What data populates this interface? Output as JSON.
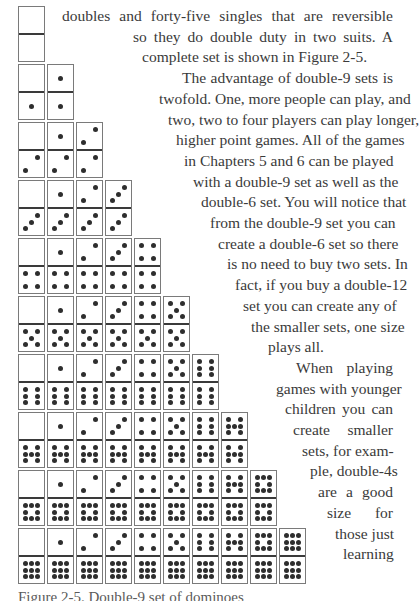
{
  "figure": {
    "name": "double-9 domino set",
    "origin_x": 18,
    "origin_y": 6,
    "col_pitch": 29,
    "row_pitch": 58,
    "rows": [
      [
        [
          0,
          0
        ]
      ],
      [
        [
          0,
          1
        ],
        [
          1,
          1
        ]
      ],
      [
        [
          0,
          2
        ],
        [
          1,
          2
        ],
        [
          2,
          2
        ]
      ],
      [
        [
          0,
          3
        ],
        [
          1,
          3
        ],
        [
          2,
          3
        ],
        [
          3,
          3
        ]
      ],
      [
        [
          0,
          4
        ],
        [
          1,
          4
        ],
        [
          2,
          4
        ],
        [
          3,
          4
        ],
        [
          4,
          4
        ]
      ],
      [
        [
          0,
          5
        ],
        [
          1,
          5
        ],
        [
          2,
          5
        ],
        [
          3,
          5
        ],
        [
          4,
          5
        ],
        [
          5,
          5
        ]
      ],
      [
        [
          0,
          6
        ],
        [
          1,
          6
        ],
        [
          2,
          6
        ],
        [
          3,
          6
        ],
        [
          4,
          6
        ],
        [
          5,
          6
        ],
        [
          6,
          6
        ]
      ],
      [
        [
          0,
          7
        ],
        [
          1,
          7
        ],
        [
          2,
          7
        ],
        [
          3,
          7
        ],
        [
          4,
          7
        ],
        [
          5,
          7
        ],
        [
          6,
          7
        ],
        [
          7,
          7
        ]
      ],
      [
        [
          0,
          8
        ],
        [
          1,
          8
        ],
        [
          2,
          8
        ],
        [
          3,
          8
        ],
        [
          4,
          8
        ],
        [
          5,
          8
        ],
        [
          6,
          8
        ],
        [
          7,
          8
        ],
        [
          8,
          8
        ]
      ],
      [
        [
          0,
          9
        ],
        [
          1,
          9
        ],
        [
          2,
          9
        ],
        [
          3,
          9
        ],
        [
          4,
          9
        ],
        [
          5,
          9
        ],
        [
          6,
          9
        ],
        [
          7,
          9
        ],
        [
          8,
          9
        ],
        [
          9,
          9
        ]
      ]
    ],
    "colors": {
      "border": "#7a7a7a",
      "divider": "#3a3a3a",
      "pip": "#2e2e2e"
    }
  },
  "body_text": {
    "right_edge": 393,
    "first_top": 6,
    "line_height": 20.7,
    "lines": [
      {
        "text": "doubles and forty-five singles that are reversible",
        "left": 62
      },
      {
        "text": "so they do double duty in two suits. A",
        "left": 133
      },
      {
        "text": "complete set is shown in Figure 2-5.",
        "left": 142,
        "align": "left"
      },
      {
        "text": "The advantage of double-9 sets is",
        "left": 182
      },
      {
        "text": "twofold. One, more people can play, and",
        "left": 159
      },
      {
        "text": "two, two to four players can play longer,",
        "left": 168
      },
      {
        "text": "higher point games. All of the games",
        "left": 176
      },
      {
        "text": "in Chapters 5 and 6 can be played",
        "left": 184
      },
      {
        "text": "with a double-9 set as well as the",
        "left": 193
      },
      {
        "text": "double-6 set. You will notice that",
        "left": 201
      },
      {
        "text": "from the double-9 set you can",
        "left": 210
      },
      {
        "text": "create a double-6 set so there",
        "left": 218
      },
      {
        "text": "is no need to buy two sets. In",
        "left": 227
      },
      {
        "text": "fact, if you buy a double-12",
        "left": 235
      },
      {
        "text": "set you can create any of",
        "left": 243
      },
      {
        "text": "the smaller sets, one size",
        "left": 251
      },
      {
        "text": "plays all.",
        "left": 268,
        "align": "left"
      },
      {
        "text": "When playing",
        "left": 296
      },
      {
        "text": "games with younger",
        "left": 276
      },
      {
        "text": "children you can",
        "left": 285
      },
      {
        "text": "create smaller",
        "left": 293
      },
      {
        "text": "sets, for exam-",
        "left": 302
      },
      {
        "text": "ple, double-4s",
        "left": 310
      },
      {
        "text": "are a good",
        "left": 318
      },
      {
        "text": "size for",
        "left": 327
      },
      {
        "text": "those just",
        "left": 335
      },
      {
        "text": "learning",
        "left": 343
      }
    ]
  },
  "caption": {
    "text": "Figure 2-5. Double-9 set of dominoes"
  }
}
